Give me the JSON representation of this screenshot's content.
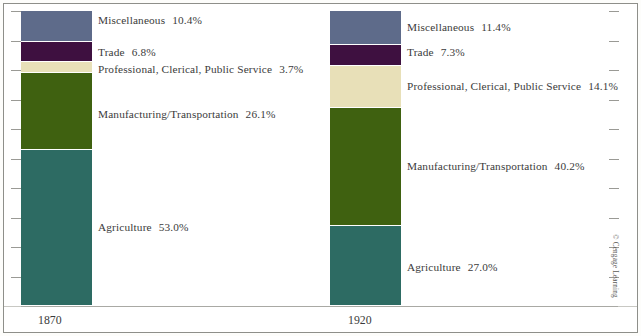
{
  "figure": {
    "credit": "© Cengage Learning",
    "axis": {
      "tick_count": 11,
      "tick_side_left": true,
      "tick_side_right": true,
      "grid": false
    },
    "colors": {
      "miscellaneous": "#5e6b8a",
      "trade": "#3e1040",
      "professional": "#e8e0b8",
      "manufacturing": "#3f6110",
      "agriculture": "#2d6b63",
      "frame": "#8e8f8a",
      "text": "#3b3b3b",
      "background": "#ffffff"
    }
  },
  "chart_data": {
    "type": "bar",
    "subtype": "stacked-100-percent",
    "title": "",
    "subtitle": "",
    "xlabel": "",
    "ylabel": "",
    "ylim": [
      0,
      100
    ],
    "grid": false,
    "legend_position": "inline-right-of-bar",
    "categories": [
      "1870",
      "1920"
    ],
    "series": [
      {
        "name": "Agriculture",
        "values": [
          53.0,
          27.0
        ],
        "color": "#2d6b63"
      },
      {
        "name": "Manufacturing/Transportation",
        "values": [
          26.1,
          40.2
        ],
        "color": "#3f6110"
      },
      {
        "name": "Professional, Clerical, Public Service",
        "values": [
          3.7,
          14.1
        ],
        "color": "#e8e0b8"
      },
      {
        "name": "Trade",
        "values": [
          6.8,
          7.3
        ],
        "color": "#3e1040"
      },
      {
        "name": "Miscellaneous",
        "values": [
          10.4,
          11.4
        ],
        "color": "#5e6b8a"
      }
    ],
    "annotations": [
      "Miscellaneous  10.4%",
      "Trade  6.8%",
      "Professional, Clerical, Public Service  3.7%",
      "Manufacturing/Transportation  26.1%",
      "Agriculture  53.0%",
      "Miscellaneous  11.4%",
      "Trade  7.3%",
      "Professional, Clerical, Public Service  14.1%",
      "Manufacturing/Transportation  40.2%",
      "Agriculture  27.0%"
    ]
  },
  "bars": [
    {
      "year": "1870",
      "segments": [
        {
          "label": "Miscellaneous",
          "pct": "10.4%"
        },
        {
          "label": "Trade",
          "pct": "6.8%"
        },
        {
          "label": "Professional, Clerical, Public Service",
          "pct": "3.7%"
        },
        {
          "label": "Manufacturing/Transportation",
          "pct": "26.1%"
        },
        {
          "label": "Agriculture",
          "pct": "53.0%"
        }
      ]
    },
    {
      "year": "1920",
      "segments": [
        {
          "label": "Miscellaneous",
          "pct": "11.4%"
        },
        {
          "label": "Trade",
          "pct": "7.3%"
        },
        {
          "label": "Professional, Clerical, Public Service",
          "pct": "14.1%"
        },
        {
          "label": "Manufacturing/Transportation",
          "pct": "40.2%"
        },
        {
          "label": "Agriculture",
          "pct": "27.0%"
        }
      ]
    }
  ]
}
